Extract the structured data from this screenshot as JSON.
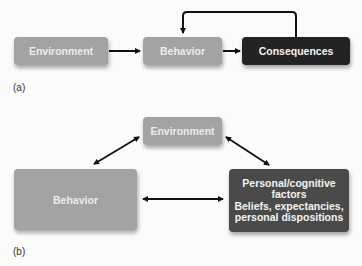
{
  "panel_a": {
    "label": "(a)",
    "nodes": {
      "environment": "Environment",
      "behavior": "Behavior",
      "consequences": "Consequences"
    },
    "edges": [
      {
        "from": "environment",
        "to": "behavior",
        "type": "arrow"
      },
      {
        "from": "behavior",
        "to": "consequences",
        "type": "arrow"
      },
      {
        "from": "consequences",
        "to": "behavior",
        "type": "feedback-arrow"
      }
    ]
  },
  "panel_b": {
    "label": "(b)",
    "nodes": {
      "environment": "Environment",
      "behavior": "Behavior",
      "personal_line1": "Personal/cognitive",
      "personal_line2": "factors",
      "personal_line3": "Beliefs, expectancies,",
      "personal_line4": "personal dispositions"
    },
    "edges": [
      {
        "from": "environment",
        "to": "behavior",
        "type": "double-arrow"
      },
      {
        "from": "environment",
        "to": "personal",
        "type": "double-arrow"
      },
      {
        "from": "behavior",
        "to": "personal",
        "type": "double-arrow"
      }
    ]
  },
  "colors": {
    "light_box": "#a3a3a3",
    "dark_box": "#232323",
    "mid_box": "#4a4a4a",
    "arrow": "#111111"
  }
}
